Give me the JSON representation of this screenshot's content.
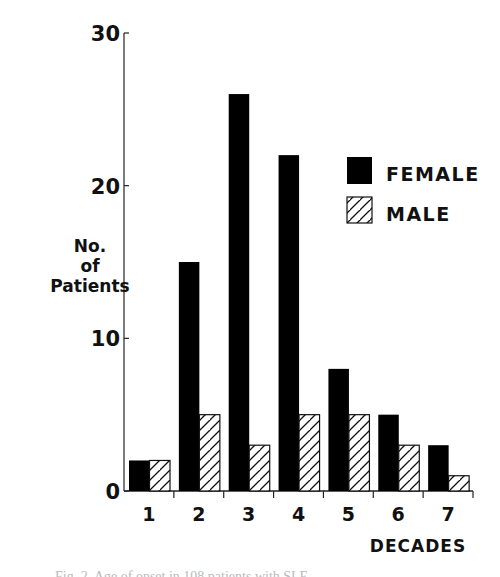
{
  "chart_data": {
    "type": "bar",
    "title": "",
    "xlabel": "DECADES",
    "ylabel": "No. of Patients",
    "ylabel_lines": [
      "No.",
      "of",
      "Patients"
    ],
    "categories": [
      "1",
      "2",
      "3",
      "4",
      "5",
      "6",
      "7"
    ],
    "series": [
      {
        "name": "FEMALE",
        "fill": "solid",
        "color": "#000000",
        "values": [
          2,
          15,
          26,
          22,
          8,
          5,
          3
        ]
      },
      {
        "name": "MALE",
        "fill": "hatched",
        "color": "#000000",
        "values": [
          2,
          5,
          3,
          5,
          5,
          3,
          1
        ]
      }
    ],
    "ylim": [
      0,
      30
    ],
    "yticks": [
      0,
      10,
      20,
      30
    ],
    "grid": false,
    "legend": {
      "placement": "right",
      "entries": [
        "FEMALE",
        "MALE"
      ]
    }
  },
  "caption": "Fig. 2. Age of onset in 108 patients with SLE"
}
